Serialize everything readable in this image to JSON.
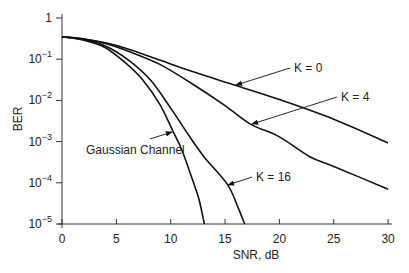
{
  "chart_data": {
    "type": "line",
    "title": "",
    "xlabel": "SNR, dB",
    "ylabel": "BER",
    "xlim": [
      0,
      30
    ],
    "ylim": [
      1e-05,
      1
    ],
    "yscale": "log",
    "grid": false,
    "legend": "inline annotations with arrows",
    "x_ticks": [
      "0",
      "5",
      "10",
      "15",
      "20",
      "25",
      "30"
    ],
    "y_ticks": [
      "1",
      "10^-1",
      "10^-2",
      "10^-3",
      "10^-4",
      "10^-5"
    ],
    "series": [
      {
        "name": "K = 0",
        "x": [
          0,
          2,
          4,
          6,
          9,
          12,
          16,
          20,
          25,
          30
        ],
        "y": [
          0.35,
          0.31,
          0.25,
          0.18,
          0.095,
          0.05,
          0.023,
          0.0105,
          0.0035,
          0.00093
        ]
      },
      {
        "name": "K = 4",
        "x": [
          0,
          2,
          4,
          6,
          9,
          12,
          15,
          17.3,
          20,
          22.8,
          25,
          30
        ],
        "y": [
          0.35,
          0.31,
          0.24,
          0.16,
          0.075,
          0.025,
          0.0075,
          0.0027,
          0.0013,
          0.00043,
          0.00025,
          7e-05
        ]
      },
      {
        "name": "K = 16",
        "x": [
          0,
          2,
          4,
          6,
          8.1,
          10,
          11.4,
          13,
          15.2,
          16.2,
          16.8
        ],
        "y": [
          0.35,
          0.3,
          0.21,
          0.1,
          0.032,
          0.0065,
          0.0018,
          0.00045,
          9.3e-05,
          2.5e-05,
          1e-05
        ]
      },
      {
        "name": "Gaussian Channel",
        "x": [
          0,
          2,
          4,
          6,
          7.4,
          9,
          10.2,
          11,
          12,
          12.6,
          13.1
        ],
        "y": [
          0.35,
          0.29,
          0.19,
          0.075,
          0.032,
          0.008,
          0.0018,
          0.00065,
          0.00012,
          4e-05,
          1e-05
        ]
      }
    ],
    "annotations": [
      {
        "text": "K = 0",
        "points_to_x": 16,
        "series": "K = 0"
      },
      {
        "text": "K = 4",
        "points_to_x": 17.3,
        "series": "K = 4"
      },
      {
        "text": "K = 16",
        "points_to_x": 15.3,
        "series": "K = 16"
      },
      {
        "text": "Gaussian Channel",
        "points_to_x": 10.2,
        "series": "Gaussian Channel"
      }
    ]
  }
}
